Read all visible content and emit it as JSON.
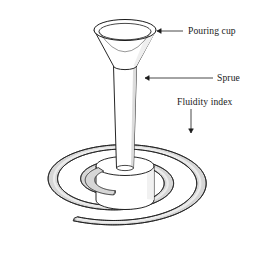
{
  "figure": {
    "type": "technical-line-diagram",
    "background_color": "#ffffff",
    "line_color": "#1a1a1a",
    "shade_color": "#d6d6d6",
    "shade_color_dark": "#bdbdbd",
    "fill_color": "#ffffff"
  },
  "labels": {
    "pouring_cup": "Pouring cup",
    "sprue": "Sprue",
    "fluidity_index": "Fluidity index"
  },
  "label_positions": {
    "pouring_cup": {
      "text_x": 188,
      "text_y": 34,
      "leader_x1": 183,
      "leader_y1": 31,
      "leader_x2": 157,
      "leader_y2": 31,
      "arrow_dir": "left"
    },
    "sprue": {
      "text_x": 217,
      "text_y": 81,
      "leader_x1": 213,
      "leader_y1": 78,
      "leader_x2": 145,
      "leader_y2": 78,
      "arrow_dir": "left"
    },
    "fluidity_index": {
      "text_x": 177,
      "text_y": 105,
      "leader_x1": 191,
      "leader_y1": 109,
      "leader_x2": 191,
      "leader_y2": 133,
      "arrow_dir": "down"
    }
  },
  "parts": {
    "pouring_cup": {
      "name": "pouring-cup",
      "rim_center_x": 125,
      "rim_center_y": 30,
      "rim_rx": 31,
      "rim_ry": 10.5,
      "inner_rx": 26,
      "inner_ry": 8.2,
      "throat_center_y": 66,
      "throat_rx": 11.5,
      "throat_ry": 3.6
    },
    "sprue": {
      "name": "sprue",
      "top_y": 66,
      "top_half_width": 11.5,
      "bottom_y": 168,
      "bottom_half_width": 8.5,
      "center_x": 125
    },
    "sprue_well": {
      "name": "sprue-well-cylinder",
      "center_x": 125,
      "top_y": 166,
      "bottom_y": 200,
      "rx": 29,
      "ry": 9.5
    },
    "fluidity_spiral": {
      "name": "fluidity-index-spiral",
      "center_x": 119,
      "center_y": 181,
      "turns": 2.05,
      "ribbon_width": 9.5,
      "aspect_ratio": 0.46,
      "start_radius": 26,
      "end_radius": 93,
      "outer_end_angle_deg": 100,
      "description": "Archimedean spiral channel shown in perspective as flattened ellipses, gray shaded"
    }
  }
}
